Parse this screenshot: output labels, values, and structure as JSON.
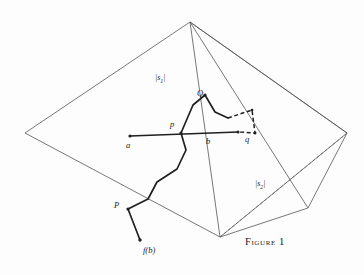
{
  "figure": {
    "caption": "Figure 1",
    "background_color": "#fdfdfd",
    "stroke_color": "#2b2b2b",
    "thin_stroke_color": "#555555",
    "labels": {
      "sector_left": "|s",
      "sector_left_sub": "1",
      "sector_left_close": "|",
      "sector_right": "|s",
      "sector_right_sub": "2",
      "sector_right_close": "|",
      "point_a": "a",
      "point_b": "b",
      "point_p_lower": "p",
      "point_q_lower": "q",
      "point_P_upper": "P",
      "point_Q_upper": "Q",
      "point_fb": "f(b)"
    }
  },
  "geometry": {
    "apex": [
      190,
      22
    ],
    "left_vertex": [
      25,
      133
    ],
    "right_vertex": [
      347,
      133
    ],
    "bottom_vertex": [
      220,
      237
    ],
    "right_lower_vertex": [
      308,
      208
    ],
    "outer_quad": "25,133 190,22 347,133 220,237",
    "spokes_from_apex": [
      [
        190,
        22,
        220,
        237
      ],
      [
        190,
        22,
        308,
        208
      ],
      [
        190,
        22,
        347,
        133
      ]
    ],
    "right_flap": "347,133 308,208 220,237",
    "dashed_diagonal": [
      220,
      237,
      347,
      133
    ],
    "baseline_ab": [
      130,
      136,
      238,
      132
    ],
    "thick_path": "130,136 181,133 193,105 205,95 215,112 228,118",
    "lower_path": "181,133 186,150 177,169 157,182 148,199 128,209 140,240",
    "dashed_path": "228,118 252,110 255,133 238,132"
  },
  "label_positions": {
    "sector_left": [
      155,
      76
    ],
    "sector_right": [
      255,
      182
    ],
    "point_a": [
      128,
      146
    ],
    "point_b": [
      208,
      141
    ],
    "point_p_lower": [
      172,
      124
    ],
    "point_q_lower": [
      245,
      139
    ],
    "point_P_upper": [
      115,
      205
    ],
    "point_Q_upper": [
      197,
      95
    ],
    "point_fb": [
      142,
      252
    ],
    "caption": [
      248,
      237
    ]
  }
}
